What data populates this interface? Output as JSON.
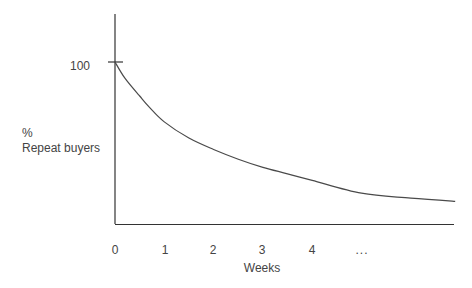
{
  "chart_data": {
    "type": "line",
    "title": "",
    "xlabel": "Weeks",
    "ylabel_line1": "%",
    "ylabel_line2": "Repeat buyers",
    "y_tick_label": "100",
    "x_tick_labels": [
      "0",
      "1",
      "2",
      "3",
      "4",
      "..."
    ],
    "grid": false,
    "legend": "none",
    "xlim": [
      0,
      6.9
    ],
    "ylim": [
      0,
      100
    ],
    "series": [
      {
        "name": "Repeat buyers",
        "x": [
          0,
          0.2,
          0.5,
          0.7,
          1,
          1.5,
          2,
          2.5,
          3,
          3.5,
          4,
          5,
          6,
          6.9
        ],
        "values": [
          100,
          90,
          79,
          72,
          63,
          53,
          46,
          40,
          35,
          31,
          27,
          19,
          16,
          14
        ]
      }
    ],
    "line_color": "#4a4a4a",
    "axis_color": "#333333"
  }
}
